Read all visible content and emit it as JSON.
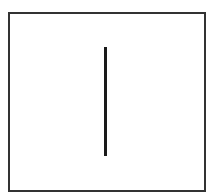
{
  "diagram": {
    "frame": {
      "shape": "rectangle",
      "stroke_color": "#333333",
      "fill_color": "#ffffff"
    },
    "elements": [
      {
        "type": "line",
        "orientation": "vertical",
        "color": "#1a1a1a"
      }
    ]
  }
}
